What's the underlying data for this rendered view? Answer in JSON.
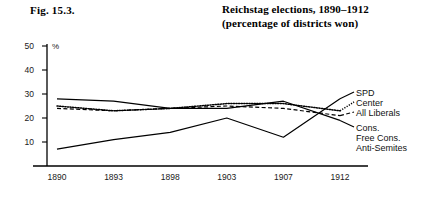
{
  "figure": {
    "number": "Fig. 15.3.",
    "title_line1": "Reichstag elections, 1890–1912",
    "title_line2": "(percentage of districts won)"
  },
  "chart_data": {
    "type": "line",
    "title": "Reichstag elections, 1890–1912 (percentage of districts won)",
    "xlabel": "",
    "ylabel": "%",
    "unit_label": "%",
    "x": [
      "1890",
      "1893",
      "1898",
      "1903",
      "1907",
      "1912"
    ],
    "categories": [
      "1890",
      "1893",
      "1898",
      "1903",
      "1907",
      "1912"
    ],
    "ylim": [
      0,
      50
    ],
    "yticks": [
      0,
      10,
      20,
      30,
      40,
      50
    ],
    "ytick_labels": [
      "10",
      "20",
      "30",
      "40",
      "50"
    ],
    "grid": false,
    "legend_position": "right",
    "series": [
      {
        "name": "SPD",
        "style": "solid",
        "values": [
          7,
          11,
          14,
          20,
          12,
          28
        ]
      },
      {
        "name": "Center",
        "style": "dotted",
        "values": [
          25,
          23,
          24,
          26,
          26,
          23
        ]
      },
      {
        "name": "All Liberals",
        "style": "dashed",
        "values": [
          24,
          23,
          24,
          25,
          24,
          21
        ]
      },
      {
        "name": "Cons., Free Cons., Anti-Semites",
        "style": "solid",
        "values": [
          28,
          27,
          24,
          24,
          27,
          19
        ]
      }
    ]
  },
  "legend": {
    "items": [
      {
        "label": "SPD"
      },
      {
        "label": "Center"
      },
      {
        "label": "All Liberals"
      },
      {
        "label": "Cons."
      },
      {
        "label": "Free Cons."
      },
      {
        "label": "Anti-Semites"
      }
    ]
  },
  "colors": {
    "ink": "#000000",
    "background": "#ffffff"
  }
}
